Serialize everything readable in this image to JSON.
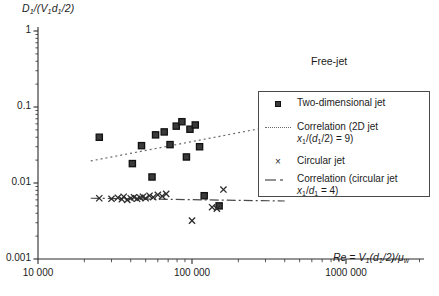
{
  "figure": {
    "annotation": "Free-jet",
    "caption_partial": "Fig. 3  Dimensionless jet diameter"
  },
  "axes": {
    "y_label_prefix": "D",
    "y_label_full": "D1/(V1d1/2)",
    "y_ticks": [
      "1",
      "0.1",
      "0.01",
      "0.001"
    ],
    "x_ticks": [
      "10 000",
      "100 000",
      "1000 000"
    ],
    "x_title": "Re = V1(d1/2)/μw"
  },
  "legend": {
    "items": [
      {
        "key": "square-marker",
        "label": "Two-dimensional jet",
        "label2": ""
      },
      {
        "key": "dotted-line",
        "label": "Correlation (2D jet",
        "label2": "x1/(d1/2) = 9)"
      },
      {
        "key": "cross-marker",
        "label": "Circular jet",
        "label2": ""
      },
      {
        "key": "dashdot-line",
        "label": "Correlation (circular jet",
        "label2": "x1/d1 = 4)"
      }
    ]
  },
  "colors": {
    "axis": "#2b2b2b",
    "square_fill": "#3a3a3a",
    "cross": "#2b2b2b",
    "dotted": "#6a6a6a",
    "dashdot": "#4a4a4a",
    "background": "#ffffff"
  },
  "chart_data": {
    "type": "scatter",
    "title": "",
    "xlabel": "Re = V1(d1/2)/μw",
    "ylabel": "D1/(V1d1/2)",
    "xscale": "log",
    "yscale": "log",
    "xlim": [
      10000,
      2000000
    ],
    "ylim": [
      0.001,
      1
    ],
    "grid": false,
    "legend_position": "right-middle",
    "series": [
      {
        "name": "Two-dimensional jet",
        "marker": "square",
        "points": [
          [
            25000,
            0.04
          ],
          [
            41000,
            0.018
          ],
          [
            47000,
            0.031
          ],
          [
            55000,
            0.012
          ],
          [
            58000,
            0.043
          ],
          [
            66000,
            0.047
          ],
          [
            72000,
            0.032
          ],
          [
            79000,
            0.056
          ],
          [
            86000,
            0.064
          ],
          [
            92000,
            0.022
          ],
          [
            97000,
            0.051
          ],
          [
            105000,
            0.058
          ],
          [
            112000,
            0.03
          ],
          [
            120000,
            0.0068
          ],
          [
            150000,
            0.005
          ]
        ]
      },
      {
        "name": "Circular jet",
        "marker": "cross",
        "points": [
          [
            25000,
            0.0063
          ],
          [
            30000,
            0.0062
          ],
          [
            33000,
            0.0064
          ],
          [
            35000,
            0.0061
          ],
          [
            36000,
            0.0066
          ],
          [
            38000,
            0.006
          ],
          [
            40000,
            0.0063
          ],
          [
            42000,
            0.0065
          ],
          [
            44000,
            0.0062
          ],
          [
            46000,
            0.0064
          ],
          [
            48000,
            0.0066
          ],
          [
            50000,
            0.0063
          ],
          [
            53000,
            0.0068
          ],
          [
            56000,
            0.0065
          ],
          [
            60000,
            0.007
          ],
          [
            64000,
            0.0067
          ],
          [
            68000,
            0.0072
          ],
          [
            100000,
            0.0032
          ],
          [
            135000,
            0.0048
          ],
          [
            145000,
            0.0046
          ],
          [
            160000,
            0.0082
          ]
        ]
      }
    ],
    "fit_lines": [
      {
        "name": "Correlation (2D jet x1/(d1/2) = 9)",
        "style": "dotted",
        "x_from": 22000,
        "y_from": 0.0195,
        "x_to": 400000,
        "y_to": 0.06
      },
      {
        "name": "Correlation (circular jet x1/d1 = 4)",
        "style": "dashdot",
        "x_from": 22000,
        "y_from": 0.0063,
        "x_to": 400000,
        "y_to": 0.0058
      }
    ]
  }
}
